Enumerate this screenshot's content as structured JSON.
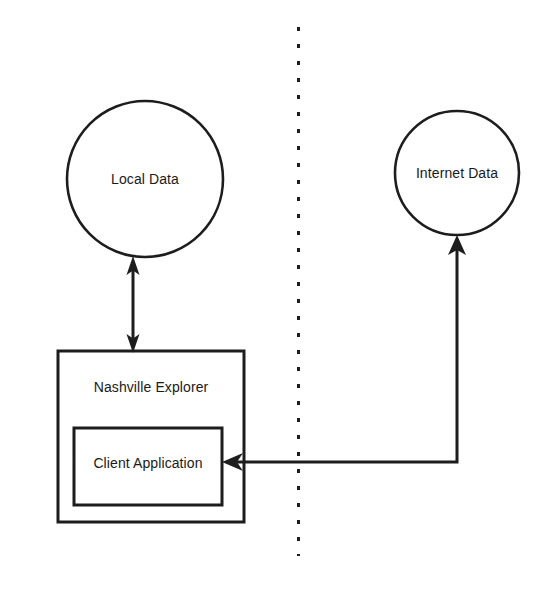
{
  "diagram": {
    "background_color": "#ffffff",
    "stroke_color": "#1d1d1d",
    "text_color": "#1a1a1a",
    "nodes": {
      "local_data": {
        "label": "Local Data",
        "shape": "circle",
        "cx": 145,
        "cy": 179,
        "r": 78
      },
      "internet_data": {
        "label": "Internet Data",
        "shape": "circle",
        "cx": 457,
        "cy": 173,
        "r": 62
      },
      "nashville_explorer": {
        "label": "Nashville Explorer",
        "shape": "rectangle",
        "x": 58,
        "y": 351,
        "width": 186,
        "height": 171
      },
      "client_application": {
        "label": "Client Application",
        "shape": "rectangle",
        "x": 74,
        "y": 428,
        "width": 148,
        "height": 77
      }
    },
    "connectors": {
      "local_data_link": {
        "name": "local-data-bidirectional-arrow",
        "from": "Nashville Explorer",
        "to": "Local Data",
        "direction": "bidirectional"
      },
      "internet_data_link": {
        "name": "internet-data-arrow",
        "from": "Internet Data",
        "to": "Client Application",
        "direction": "unidirectional"
      }
    },
    "divider": {
      "name": "boundary-divider",
      "style": "dashed-vertical",
      "x": 298,
      "y_start": 27,
      "y_end": 556
    }
  }
}
